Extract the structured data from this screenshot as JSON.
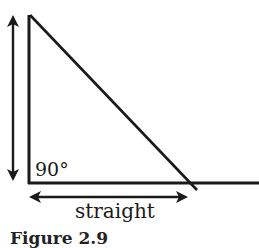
{
  "figure": {
    "angle_label": "90°",
    "base_label": "straight",
    "caption": "Figure 2.9",
    "line_color": "#1a1a1a",
    "shapes": {
      "vertical_side": {
        "x1": 29,
        "y1": 15,
        "x2": 29,
        "y2": 183
      },
      "baseline": {
        "x1": 29,
        "y1": 183,
        "x2": 259,
        "y2": 183
      },
      "hypotenuse": {
        "x1": 29,
        "y1": 15,
        "x2": 197,
        "y2": 190
      },
      "height_arrow": {
        "x": 13,
        "y1": 16,
        "y2": 180
      },
      "base_arrow": {
        "y": 197,
        "x1": 30,
        "x2": 187
      }
    }
  }
}
